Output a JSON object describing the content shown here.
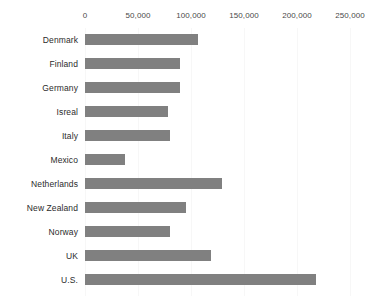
{
  "chart_data": {
    "type": "bar",
    "orientation": "horizontal",
    "title": "",
    "subtitle": "",
    "xlabel": "",
    "ylabel": "",
    "xlim": [
      0,
      250000
    ],
    "ylim": null,
    "grid": true,
    "grid_axis": "x",
    "legend": null,
    "legend_position": "none",
    "axis_position": "top",
    "bar_color": "#808080",
    "gridline_color": "#f7f7f7",
    "background_color": "#ffffff",
    "label_color": "#2b2b2b",
    "tick_color": "#4a4a4a",
    "categories": [
      "Denmark",
      "Finland",
      "Germany",
      "Isreal",
      "Italy",
      "Mexico",
      "Netherlands",
      "New Zealand",
      "Norway",
      "UK",
      "U.S."
    ],
    "values": [
      107000,
      90000,
      90000,
      78000,
      80000,
      38000,
      129000,
      95000,
      80000,
      119000,
      218000
    ],
    "xticks": [
      0,
      50000,
      100000,
      150000,
      200000,
      250000
    ],
    "xticklabels": [
      "0",
      "50,000",
      "100,000",
      "150,000",
      "200,000",
      "250,000"
    ]
  }
}
